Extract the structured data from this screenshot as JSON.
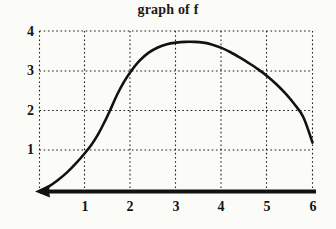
{
  "figure": {
    "title": "graph of f",
    "background_color": "#fbfbf8",
    "ink_color": "#121212"
  },
  "axes": {
    "x_tick_labels": [
      "1",
      "2",
      "3",
      "4",
      "5",
      "6"
    ],
    "y_tick_labels": [
      "1",
      "2",
      "3",
      "4"
    ],
    "x_axis_style": "thick solid line with left arrowhead",
    "grid_style": "dotted"
  },
  "chart_data": {
    "type": "line",
    "title": "graph of f",
    "xlabel": "",
    "ylabel": "",
    "xlim": [
      0,
      6
    ],
    "ylim": [
      0,
      4
    ],
    "xticks": [
      1,
      2,
      3,
      4,
      5,
      6
    ],
    "yticks": [
      1,
      2,
      3,
      4
    ],
    "grid": true,
    "grid_linestyle": "dotted",
    "legend": null,
    "series": [
      {
        "name": "f",
        "color": "#121212",
        "linewidth": 2.6,
        "x": [
          0.0,
          0.2,
          0.4,
          0.6,
          0.8,
          1.0,
          1.15,
          1.3,
          1.45,
          1.55,
          1.7,
          1.85,
          2.0,
          2.2,
          2.4,
          2.6,
          2.8,
          3.0,
          3.2,
          3.4,
          3.6,
          3.8,
          4.0,
          4.2,
          4.4,
          4.6,
          4.8,
          5.0,
          5.2,
          5.4,
          5.6,
          5.8,
          6.0
        ],
        "y": [
          0.0,
          0.12,
          0.28,
          0.47,
          0.7,
          0.96,
          1.18,
          1.45,
          1.78,
          2.02,
          2.4,
          2.72,
          2.98,
          3.26,
          3.46,
          3.59,
          3.67,
          3.71,
          3.73,
          3.73,
          3.71,
          3.66,
          3.58,
          3.47,
          3.34,
          3.2,
          3.05,
          2.88,
          2.68,
          2.45,
          2.18,
          1.85,
          1.22
        ]
      }
    ],
    "annotations": [
      {
        "text": "curve passes through (1, 1)",
        "x": 1.0,
        "y": 1.0
      },
      {
        "text": "curve passes through (2, 3)",
        "x": 2.0,
        "y": 3.0
      },
      {
        "text": "maximum near x = 3.3",
        "x": 3.3,
        "y": 3.73
      },
      {
        "text": "curve ends near (6, 1.2)",
        "x": 6.0,
        "y": 1.22
      }
    ]
  }
}
